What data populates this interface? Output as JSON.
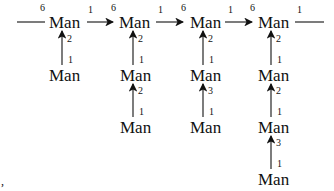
{
  "diagram": {
    "node_label": "Man",
    "top_row": [
      {
        "label": "Man",
        "in_index": "6",
        "out_index": "1"
      },
      {
        "label": "Man",
        "in_index": "6",
        "out_index": "1"
      },
      {
        "label": "Man",
        "in_index": "6",
        "out_index": "1"
      },
      {
        "label": "Man",
        "in_index": "6",
        "out_index": "1"
      }
    ],
    "columns": [
      {
        "chain": [
          {
            "label": "Man",
            "head_index": "2",
            "tail_index": "1"
          }
        ]
      },
      {
        "chain": [
          {
            "label": "Man",
            "head_index": "2",
            "tail_index": "1"
          },
          {
            "label": "Man",
            "head_index": "2",
            "tail_index": "1"
          }
        ]
      },
      {
        "chain": [
          {
            "label": "Man",
            "head_index": "2",
            "tail_index": "1"
          },
          {
            "label": "Man",
            "head_index": "3",
            "tail_index": "1"
          }
        ]
      },
      {
        "chain": [
          {
            "label": "Man",
            "head_index": "2",
            "tail_index": "1"
          },
          {
            "label": "Man",
            "head_index": "2",
            "tail_index": "1"
          },
          {
            "label": "Man",
            "head_index": "3",
            "tail_index": "1"
          }
        ]
      }
    ],
    "stray_mark": ","
  }
}
